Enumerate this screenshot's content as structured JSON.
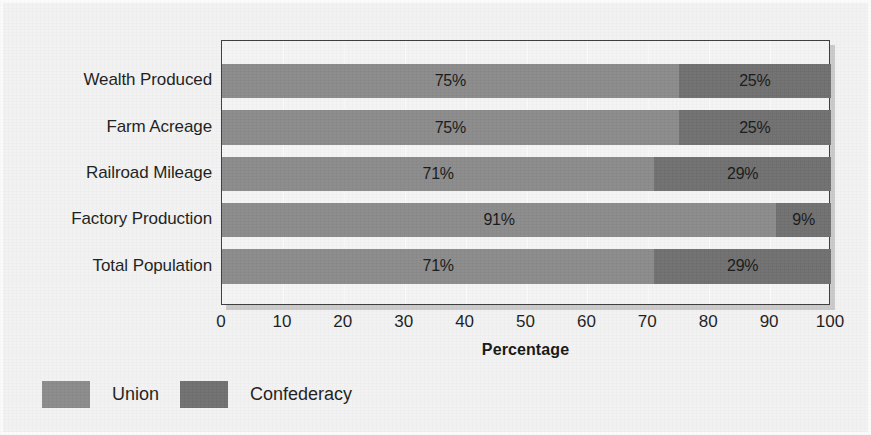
{
  "chart_data": {
    "type": "bar",
    "orientation": "horizontal",
    "stacked": true,
    "title": "",
    "xlabel": "Percentage",
    "ylabel": "",
    "xlim": [
      0,
      100
    ],
    "xticks": [
      "0",
      "10",
      "20",
      "30",
      "40",
      "50",
      "60",
      "70",
      "80",
      "90",
      "100"
    ],
    "grid": true,
    "legend_position": "bottom-left",
    "categories": [
      "Wealth Produced",
      "Farm Acreage",
      "Railroad Mileage",
      "Factory Production",
      "Total Population"
    ],
    "series": [
      {
        "name": "Union",
        "color": "#8a8a8a",
        "values": [
          75,
          75,
          71,
          91,
          71
        ],
        "labels": [
          "75%",
          "75%",
          "71%",
          "91%",
          "71%"
        ]
      },
      {
        "name": "Confederacy",
        "color": "#6e6e6e",
        "values": [
          25,
          25,
          29,
          9,
          29
        ],
        "labels": [
          "25%",
          "25%",
          "29%",
          "9%",
          "29%"
        ]
      }
    ]
  },
  "legend": {
    "items": [
      {
        "label": "Union",
        "color": "#8a8a8a"
      },
      {
        "label": "Confederacy",
        "color": "#6e6e6e"
      }
    ]
  },
  "colors": {
    "union": "#8a8a8a",
    "confederacy": "#6e6e6e",
    "plot_background": "#f4f4f4",
    "figure_background": "#f2f2f2",
    "frame": "#3a3a3a",
    "text": "#1b1b1b"
  }
}
